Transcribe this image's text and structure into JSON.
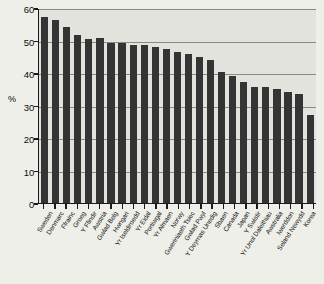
{
  "chart_data": {
    "type": "bar",
    "title": "",
    "xlabel": "",
    "ylabel": "%",
    "ylim": [
      0,
      60
    ],
    "ytick_values": [
      0,
      10,
      20,
      30,
      40,
      50,
      60
    ],
    "ytick_labels": [
      "0",
      "10",
      "20",
      "30",
      "40",
      "50",
      "60"
    ],
    "grid": true,
    "legend": null,
    "bar_color": "#343434",
    "plot_background": "#e3e3de",
    "figure_background": "#efefea",
    "categories": [
      "Sweden",
      "Denmarc",
      "Ffrainc",
      "Groeg",
      "Y Ffindir",
      "Awstria",
      "Gwlad Belg",
      "Hwngari",
      "Yr Iseldiroedd",
      "Yr Eidal",
      "Portiwgal",
      "Yr Almaen",
      "Norwy",
      "Gweriniaeth Tsiec",
      "Gwlad Pwyl",
      "Y Deyrnas Unedig",
      "Sbaen",
      "Canada",
      "Japan",
      "Y Swistir",
      "Yr Unol Daleithiau",
      "Awstralia",
      "Iwerddon",
      "Seland Newydd",
      "Korea"
    ],
    "values": [
      57.2,
      56.2,
      54.2,
      51.8,
      50.5,
      50.7,
      49.3,
      49.2,
      48.6,
      48.6,
      48.0,
      47.3,
      46.4,
      45.8,
      44.8,
      43.9,
      40.4,
      39.2,
      37.3,
      35.6,
      35.8,
      35.2,
      34.1,
      33.5,
      27.2
    ]
  }
}
